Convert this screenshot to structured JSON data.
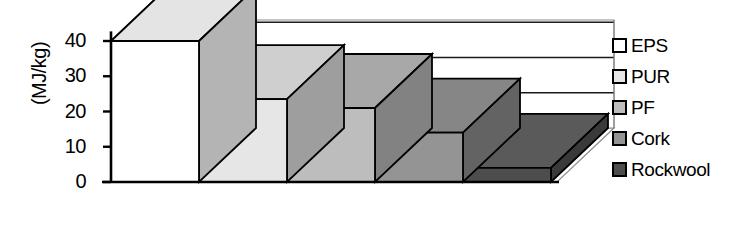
{
  "chart_data": {
    "type": "bar",
    "title": "",
    "xlabel": "",
    "ylabel": "(MJ/kg)",
    "ylim": [
      0,
      45
    ],
    "yticks": [
      0,
      10,
      20,
      30,
      40
    ],
    "grid": true,
    "three_d": true,
    "legend_position": "right",
    "categories": [
      "EPS",
      "PUR",
      "PF",
      "Cork",
      "Rockwool"
    ],
    "values": [
      40,
      23.5,
      21,
      14,
      4
    ],
    "units": "MJ/kg",
    "series": [
      {
        "name": "Embodied energy",
        "values": [
          40,
          23.5,
          21,
          14,
          4
        ]
      }
    ],
    "bars": [
      {
        "label": "EPS",
        "value": 40,
        "face_color": "#ffffff",
        "top_color": "#e4e4e4",
        "side_color": "#b4b4b4"
      },
      {
        "label": "PUR",
        "value": 23.5,
        "face_color": "#e6e6e6",
        "top_color": "#cfcfcf",
        "side_color": "#9e9e9e"
      },
      {
        "label": "PF",
        "value": 21,
        "face_color": "#bdbdbd",
        "top_color": "#a8a8a8",
        "side_color": "#828282"
      },
      {
        "label": "Cork",
        "value": 14,
        "face_color": "#949494",
        "top_color": "#868686",
        "side_color": "#636363"
      },
      {
        "label": "Rockwool",
        "value": 4,
        "face_color": "#4d4d4d",
        "top_color": "#5a5a5a",
        "side_color": "#3a3a3a"
      }
    ]
  },
  "axis": {
    "y_label": "(MJ/kg)",
    "ticks": [
      {
        "text": "40",
        "value": 40
      },
      {
        "text": "30",
        "value": 30
      },
      {
        "text": "20",
        "value": 20
      },
      {
        "text": "10",
        "value": 10
      },
      {
        "text": "0",
        "value": 0
      }
    ]
  },
  "legend": {
    "items": [
      {
        "label": "EPS",
        "color": "#ffffff"
      },
      {
        "label": "PUR",
        "color": "#e6e6e6"
      },
      {
        "label": "PF",
        "color": "#bdbdbd"
      },
      {
        "label": "Cork",
        "color": "#949494"
      },
      {
        "label": "Rockwool",
        "color": "#4d4d4d"
      }
    ]
  },
  "colors": {
    "axis": "#000000",
    "grid_back": "#1a1a1a",
    "grid_floor": "#8c8c8c",
    "background": "#ffffff"
  }
}
